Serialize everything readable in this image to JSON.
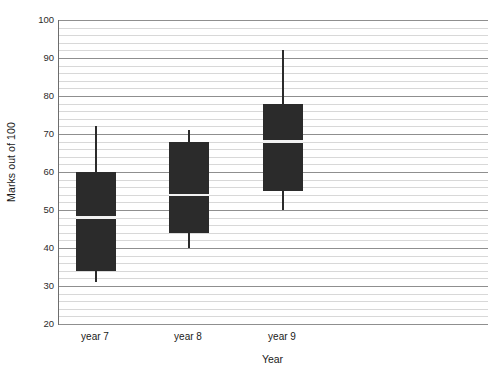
{
  "chart_data": {
    "type": "boxplot",
    "title": "",
    "xlabel": "Year",
    "ylabel": "Marks out of 100",
    "categories": [
      "year 7",
      "year 8",
      "year 9"
    ],
    "ylim": [
      20,
      100
    ],
    "y_major_ticks": [
      20,
      30,
      40,
      50,
      60,
      70,
      80,
      90,
      100
    ],
    "y_major_tick_labels": [
      "20",
      "30",
      "40",
      "50",
      "60",
      "70",
      "80",
      "90",
      "100"
    ],
    "y_minor_tick_step": 2,
    "grid": "horizontal",
    "legend": "none",
    "box_fill_color": "#2b2b2b",
    "median_line_color": "#f2f2f2",
    "gridline_color": "#d8d8d8",
    "major_gridline_color": "#8f8f8f",
    "axis_color": "#6d6d6d",
    "boxes": [
      {
        "category": "year 7",
        "whisker_low": 31,
        "q1": 34,
        "median": 48,
        "q3": 60,
        "whisker_high": 72
      },
      {
        "category": "year 8",
        "whisker_low": 40,
        "q1": 44,
        "median": 54,
        "q3": 68,
        "whisker_high": 71
      },
      {
        "category": "year 9",
        "whisker_low": 50,
        "q1": 55,
        "median": 68,
        "q3": 78,
        "whisker_high": 92
      }
    ]
  }
}
